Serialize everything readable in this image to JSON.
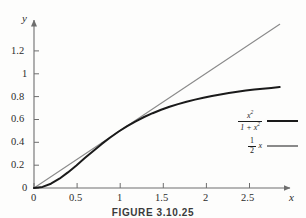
{
  "figure": {
    "caption": "FIGURE 3.10.25",
    "background_color": "#fdfdfc"
  },
  "axes": {
    "x_name": "x",
    "y_name": "y",
    "axis_color": "#6e6e6e",
    "x_tick_labels": [
      "0",
      "0.5",
      "1",
      "1.5",
      "2",
      "2.5"
    ],
    "y_tick_labels": [
      "0",
      "0.2",
      "0.4",
      "0.6",
      "0.8",
      "1",
      "1.2"
    ]
  },
  "legend": {
    "entries": [
      {
        "name": "curve-x2-over-1-plus-x2",
        "numerator": "x",
        "numerator_exponent": "2",
        "denominator_lead": "1 + x",
        "denominator_exponent": "2",
        "color": "#1a1a1a"
      },
      {
        "name": "line-half-x",
        "numerator": "1",
        "denominator": "2",
        "variable": "x",
        "color": "#8a8a8a"
      }
    ]
  },
  "chart_data": {
    "type": "line",
    "title": "FIGURE 3.10.25",
    "xlabel": "x",
    "ylabel": "y",
    "xlim": [
      0,
      2.95
    ],
    "ylim": [
      0,
      1.47
    ],
    "xticks": [
      0,
      0.5,
      1,
      1.5,
      2,
      2.5
    ],
    "yticks": [
      0,
      0.2,
      0.4,
      0.6,
      0.8,
      1,
      1.2
    ],
    "grid": false,
    "legend_position": "right-middle",
    "series": [
      {
        "name": "x^2/(1+x^2)",
        "label": "x²/(1 + x²)",
        "color": "#1a1a1a",
        "linewidth": 2.0,
        "x": [
          0,
          0.1,
          0.2,
          0.3,
          0.4,
          0.5,
          0.6,
          0.7,
          0.8,
          0.9,
          1.0,
          1.1,
          1.2,
          1.3,
          1.4,
          1.5,
          1.6,
          1.7,
          1.8,
          1.9,
          2.0,
          2.1,
          2.2,
          2.3,
          2.4,
          2.5,
          2.6,
          2.7,
          2.8,
          2.9
        ],
        "y": [
          0,
          0.0099,
          0.0385,
          0.0826,
          0.1379,
          0.2,
          0.2647,
          0.3288,
          0.3902,
          0.4475,
          0.5,
          0.5475,
          0.5902,
          0.6283,
          0.6622,
          0.6923,
          0.7191,
          0.7429,
          0.7642,
          0.7831,
          0.8,
          0.8152,
          0.8288,
          0.8411,
          0.8521,
          0.8621,
          0.8711,
          0.8793,
          0.8867,
          0.8936
        ]
      },
      {
        "name": "0.5x",
        "label": "(1/2) x",
        "color": "#8a8a8a",
        "linewidth": 1.1,
        "x": [
          0,
          2.9
        ],
        "y": [
          0,
          1.45
        ]
      }
    ]
  }
}
